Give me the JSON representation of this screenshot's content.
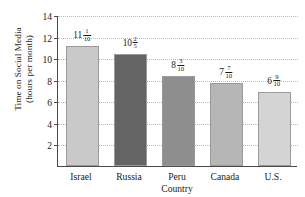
{
  "chart_data": {
    "type": "bar",
    "title": "",
    "subtitle": "",
    "xlabel": "Country",
    "ylabel": "Time on Social Media\n(hours per month)",
    "categories": [
      "Israel",
      "Russia",
      "Peru",
      "Canada",
      "U.S."
    ],
    "values": [
      11.1,
      10.4,
      8.3,
      7.7,
      6.9
    ],
    "value_labels": [
      {
        "whole": "11",
        "numerator": "1",
        "denominator": "10"
      },
      {
        "whole": "10",
        "numerator": "2",
        "denominator": "5"
      },
      {
        "whole": "8",
        "numerator": "3",
        "denominator": "10"
      },
      {
        "whole": "7",
        "numerator": "7",
        "denominator": "10"
      },
      {
        "whole": "6",
        "numerator": "9",
        "denominator": "10"
      }
    ],
    "ylim": [
      0,
      14
    ],
    "yticks": [
      2,
      4,
      6,
      8,
      10,
      12,
      14
    ],
    "ytick_labels": [
      "2",
      "4",
      "6",
      "8",
      "10",
      "12",
      "14"
    ],
    "grid": true,
    "grid_orientation": "horizontal",
    "grid_style": "dotted",
    "legend": null,
    "legend_position": "none",
    "bar_colors": [
      "#c9c9c9",
      "#646464",
      "#8e8e8e",
      "#b6b6b6",
      "#d4d4d4"
    ],
    "bar_border_color": "#9a9a9a",
    "axis_color": "#4a4a4a",
    "grid_color": "#b9b9b9",
    "background_color": "#ffffff",
    "text_color": "#1a1a1a"
  }
}
